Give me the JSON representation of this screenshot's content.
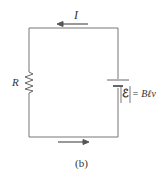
{
  "diagram": {
    "current_label": "I",
    "resistor_label": "R",
    "emf_symbol": "ℰ",
    "emf_equation": "= Bℓv",
    "caption": "(b)",
    "colors": {
      "wire": "#777777",
      "arrow": "#555555",
      "text": "#333333"
    }
  }
}
